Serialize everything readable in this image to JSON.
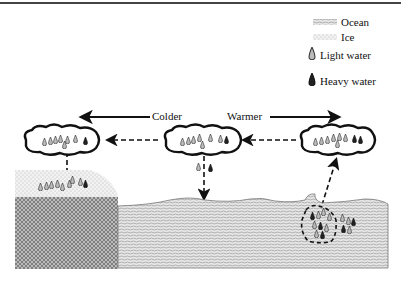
{
  "legend": {
    "ocean": "Ocean",
    "ice": "Ice",
    "light_water": "Light water",
    "heavy_water": "Heavy water"
  },
  "arrows": {
    "colder": "Colder",
    "warmer": "Warmer"
  },
  "colors": {
    "line": "#111111",
    "ocean_fill": "#cfcfcf",
    "ice_fill": "#e2e2e2",
    "land_fill": "#9a9a9a"
  }
}
